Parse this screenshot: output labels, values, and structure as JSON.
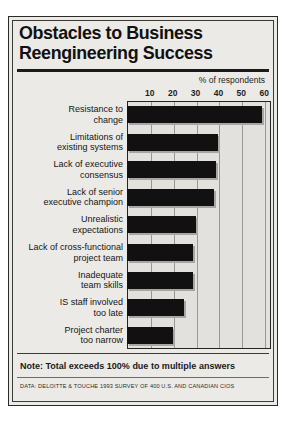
{
  "title": {
    "line1": "Obstacles to Business",
    "line2": "Reengineering Success"
  },
  "footer": {
    "note": "Note: Total exceeds 100% due to multiple answers",
    "source": "DATA: DELOITTE & TOUCHE 1993 SURVEY OF 400 U.S. AND CANADIAN CIOS"
  },
  "colors": {
    "bar": "#111111",
    "bar_shadow": "#a8a6a2",
    "plot_background": "#e3e1dd",
    "figure_background": "#eceae6",
    "gridline": "#9a9894",
    "frame": "#252525",
    "text": "#141414"
  },
  "chart_data": {
    "type": "bar",
    "orientation": "horizontal",
    "title": "Obstacles to Business Reengineering Success",
    "subtitle": "",
    "xlabel": "% of respondents",
    "ylabel": "",
    "xlim": [
      0,
      63
    ],
    "xticks": [
      10,
      20,
      30,
      40,
      50,
      60
    ],
    "xticklabels": [
      "10",
      "20",
      "30",
      "40",
      "50",
      "60"
    ],
    "grid": "vertical",
    "legend": "none",
    "categories": [
      "Resistance to\nchange",
      "Limitations of\nexisting systems",
      "Lack of executive\nconsensus",
      "Lack of senior\nexecutive champion",
      "Unrealistic\nexpectations",
      "Lack of cross-functional\nproject team",
      "Inadequate\nteam skills",
      "IS staff involved\ntoo late",
      "Project charter\ntoo narrow"
    ],
    "values": [
      59,
      40,
      39,
      38,
      30,
      29,
      29,
      25,
      20
    ],
    "annotations": [
      "Note: Total exceeds 100% due to multiple answers",
      "DATA: DELOITTE & TOUCHE 1993 SURVEY OF 400 U.S. AND CANADIAN CIOS"
    ]
  }
}
